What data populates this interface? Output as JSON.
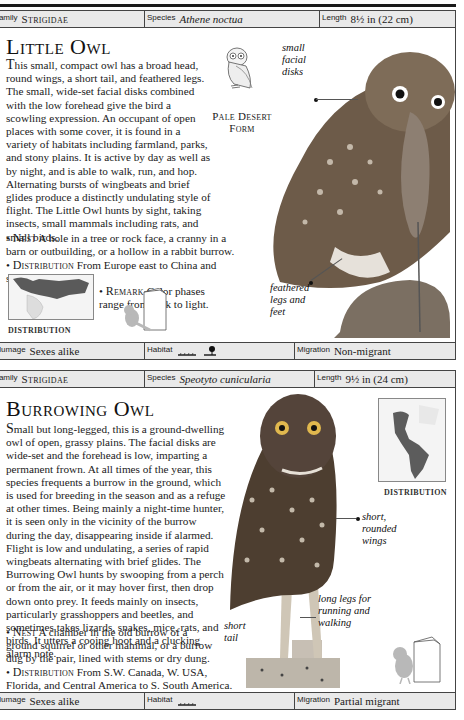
{
  "little_owl": {
    "header": {
      "family_label": "Family",
      "family_value": "Strigidae",
      "species_label": "Species",
      "species_value": "Athene noctua",
      "length_label": "Length",
      "length_value": "8½ in (22 cm)"
    },
    "title": "Little Owl",
    "description": "his small, compact owl has a broad head, round wings, a short tail, and feathered legs. The small, wide-set facial disks combined with the low forehead give the bird a scowling expression. An occupant of open places with some cover, it is found in a variety of habitats including farmland, parks, and stony plains. It is active by day as well as by night, and is able to walk, run, and hop. Alternating bursts of wingbeats and brief glides produce a distinctly undulating style of flight. The Little Owl hunts by sight, taking insects, small mammals including rats, and small birds.",
    "description_initial": "T",
    "facts": [
      {
        "label": "Nest",
        "text": "A hole in a tree or rock face, a cranny in a barn or outbuilding, or a hollow in a rabbit burrow."
      },
      {
        "label": "Distribution",
        "text": "From Europe east to China and south into Africa."
      },
      {
        "label": "Remark",
        "text": "Color phases range from dark to light."
      }
    ],
    "inset_caption": "Pale Desert Form",
    "distribution_label": "DISTRIBUTION",
    "annotations": {
      "facial_disks": "small facial disks",
      "legs": "feathered legs and feet"
    },
    "footer": {
      "plumage_label": "Plumage",
      "plumage_value": "Sexes alike",
      "habitat_label": "Habitat",
      "habitat_icons": [
        "grassland-icon",
        "woodland-edge-icon"
      ],
      "migration_label": "Migration",
      "migration_value": "Non-migrant"
    }
  },
  "burrowing_owl": {
    "header": {
      "family_label": "Family",
      "family_value": "Strigidae",
      "species_label": "Species",
      "species_value": "Speotyto cunicularia",
      "length_label": "Length",
      "length_value": "9½ in (24 cm)"
    },
    "title": "Burrowing Owl",
    "description_initial": "S",
    "description": "mall but long-legged, this is a ground-dwelling owl of open, grassy plains. The facial disks are wide-set and the forehead is low, imparting a permanent frown. At all times of the year, this species frequents a burrow in the ground, which is used for breeding in the season and as a refuge at other times. Being mainly a night-time hunter, it is seen only in the vicinity of the burrow during the day, disappearing inside if alarmed. Flight is low and undulating, a series of rapid wingbeats alternating with brief glides. The Burrowing Owl hunts by swooping from a perch or from the air, or it may hover first, then drop down onto prey. It feeds mainly on insects, particularly grasshoppers and beetles, and sometimes takes lizards, snakes, mice, rats, and birds. It utters a cooing hoot and a clucking alarm note.",
    "facts": [
      {
        "label": "Nest",
        "text": "A chamber in the old burrow of a ground squirrel or other mammal, or a burrow dug by the pair, lined with stems or dry dung."
      },
      {
        "label": "Distribution",
        "text": "From S.W. Canada, W. USA, Florida, and Central America to S. South America."
      }
    ],
    "distribution_label": "DISTRIBUTION",
    "annotations": {
      "wings": "short, rounded wings",
      "legs": "long legs for running and walking",
      "tail": "short tail"
    },
    "footer": {
      "plumage_label": "Plumage",
      "plumage_value": "Sexes alike",
      "habitat_label": "Habitat",
      "habitat_icons": [
        "grassland-icon"
      ],
      "migration_label": "Migration",
      "migration_value": "Partial migrant"
    }
  }
}
